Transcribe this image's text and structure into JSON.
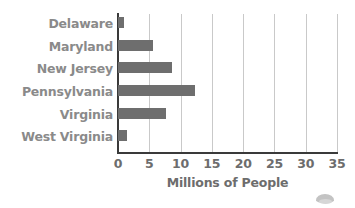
{
  "chart_data": {
    "type": "bar",
    "orientation": "horizontal",
    "title": "",
    "subtitle": "",
    "xlabel": "Millions of People",
    "ylabel": "",
    "categories": [
      "Delaware",
      "Maryland",
      "New Jersey",
      "Pennsylvania",
      "Virginia",
      "West Virginia"
    ],
    "values": [
      0.9,
      5.6,
      8.7,
      12.3,
      7.7,
      1.5
    ],
    "xlim": [
      0,
      35
    ],
    "xticks": [
      0,
      5,
      10,
      15,
      20,
      25,
      30,
      35
    ],
    "xtick_labels": [
      "0",
      "5",
      "10",
      "15",
      "20",
      "25",
      "30",
      "35"
    ],
    "grid": "vertical",
    "legend": "none",
    "series": [
      {
        "name": "Population",
        "values": [
          0.9,
          5.6,
          8.7,
          12.3,
          7.7,
          1.5
        ]
      }
    ],
    "colors": {
      "bar": "#6e6e6e",
      "gridline": "#c9c9c9",
      "axis": "#3a3a3a",
      "category_label": "#8a8a8a",
      "tick_label": "#6d6d6d",
      "axis_title": "#6d6d6d",
      "background": "#ffffff"
    }
  }
}
